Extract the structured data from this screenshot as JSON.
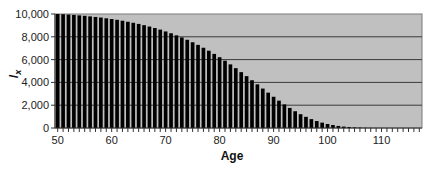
{
  "chart_data": {
    "type": "bar",
    "title": "",
    "xlabel": "Age",
    "ylabel": "l_x",
    "ylabel_main": "l",
    "ylabel_sub": "x",
    "ylim": [
      0,
      10000
    ],
    "xlim": [
      49.5,
      117.5
    ],
    "grid": true,
    "legend": "none",
    "plot_background": "#c0c0c0",
    "bar_color": "#000000",
    "y_ticks": [
      0,
      2000,
      4000,
      6000,
      8000,
      10000
    ],
    "y_tick_labels": [
      "0",
      "2,000",
      "4,000",
      "6,000",
      "8,000",
      "10,000"
    ],
    "x_ticks": [
      50,
      60,
      70,
      80,
      90,
      100,
      110
    ],
    "x_tick_labels": [
      "50",
      "60",
      "70",
      "80",
      "90",
      "100",
      "110"
    ],
    "categories": [
      50,
      51,
      52,
      53,
      54,
      55,
      56,
      57,
      58,
      59,
      60,
      61,
      62,
      63,
      64,
      65,
      66,
      67,
      68,
      69,
      70,
      71,
      72,
      73,
      74,
      75,
      76,
      77,
      78,
      79,
      80,
      81,
      82,
      83,
      84,
      85,
      86,
      87,
      88,
      89,
      90,
      91,
      92,
      93,
      94,
      95,
      96,
      97,
      98,
      99,
      100,
      101,
      102,
      103,
      104,
      105,
      106,
      107,
      108,
      109,
      110,
      111,
      112,
      113,
      114,
      115,
      116,
      117
    ],
    "values": [
      10000,
      9980,
      9950,
      9920,
      9880,
      9840,
      9790,
      9740,
      9690,
      9620,
      9560,
      9490,
      9410,
      9320,
      9230,
      9130,
      9020,
      8900,
      8770,
      8630,
      8470,
      8310,
      8130,
      7940,
      7740,
      7520,
      7290,
      7040,
      6780,
      6500,
      6210,
      5900,
      5580,
      5250,
      4900,
      4550,
      4190,
      3830,
      3460,
      3100,
      2740,
      2400,
      2070,
      1760,
      1470,
      1210,
      980,
      780,
      610,
      470,
      350,
      260,
      180,
      125,
      85,
      55,
      35,
      20,
      12,
      7,
      4,
      2,
      1,
      0,
      0,
      0,
      0,
      0
    ]
  }
}
